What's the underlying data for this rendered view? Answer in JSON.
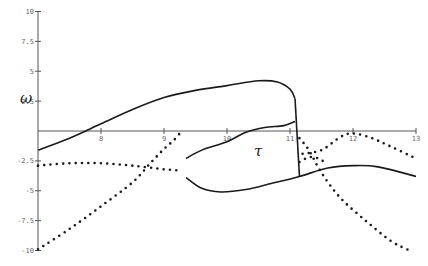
{
  "chart_data": {
    "type": "line",
    "title": "",
    "xlabel": "τ",
    "ylabel": "ω",
    "xlim": [
      7,
      13
    ],
    "ylim": [
      -10,
      10
    ],
    "grid": false,
    "legend": null,
    "x_ticks": [
      8,
      9,
      10,
      11,
      12,
      13
    ],
    "x_tick_labels": [
      "8",
      "9",
      "10",
      "11",
      "12",
      "13"
    ],
    "y_ticks": [
      10,
      7.5,
      5,
      2.5,
      -2.5,
      -5,
      -7.5,
      -10
    ],
    "y_tick_labels": [
      "10",
      "7.5",
      "5",
      "2.5",
      "-2.5",
      "-5",
      "-7.5",
      "-10"
    ],
    "series": [
      {
        "name": "solid upper branch",
        "style": "solid",
        "points": [
          [
            7.0,
            -1.6
          ],
          [
            7.5,
            -0.6
          ],
          [
            8.0,
            0.6
          ],
          [
            8.5,
            1.8
          ],
          [
            9.0,
            2.8
          ],
          [
            9.5,
            3.4
          ],
          [
            10.0,
            3.8
          ],
          [
            10.5,
            4.2
          ],
          [
            10.8,
            4.1
          ],
          [
            11.0,
            3.5
          ],
          [
            11.08,
            2.7
          ]
        ]
      },
      {
        "name": "solid vertical jump",
        "style": "solid",
        "points": [
          [
            11.08,
            2.7
          ],
          [
            11.15,
            -3.8
          ]
        ]
      },
      {
        "name": "solid middle branch",
        "style": "solid",
        "points": [
          [
            9.35,
            -2.3
          ],
          [
            9.6,
            -1.6
          ],
          [
            10.0,
            -0.9
          ],
          [
            10.3,
            -0.1
          ],
          [
            10.6,
            0.3
          ],
          [
            10.9,
            0.45
          ],
          [
            11.08,
            0.8
          ]
        ]
      },
      {
        "name": "solid lower branch",
        "style": "solid",
        "points": [
          [
            9.35,
            -3.9
          ],
          [
            9.6,
            -4.8
          ],
          [
            9.9,
            -5.1
          ],
          [
            10.3,
            -4.9
          ],
          [
            10.7,
            -4.4
          ],
          [
            11.15,
            -3.8
          ],
          [
            11.6,
            -3.1
          ],
          [
            12.0,
            -2.9
          ],
          [
            12.4,
            -3.0
          ],
          [
            13.0,
            -3.8
          ]
        ]
      },
      {
        "name": "dotted flat branch",
        "style": "dotted",
        "points": [
          [
            7.0,
            -2.9
          ],
          [
            7.5,
            -2.7
          ],
          [
            8.0,
            -2.7
          ],
          [
            8.5,
            -2.9
          ],
          [
            9.0,
            -3.2
          ],
          [
            9.25,
            -3.3
          ]
        ]
      },
      {
        "name": "dotted rising branch",
        "style": "dotted",
        "points": [
          [
            7.0,
            -9.9
          ],
          [
            7.5,
            -8.2
          ],
          [
            8.0,
            -6.3
          ],
          [
            8.5,
            -4.3
          ],
          [
            8.8,
            -2.6
          ],
          [
            9.0,
            -1.5
          ],
          [
            9.15,
            -0.8
          ],
          [
            9.25,
            -0.2
          ]
        ]
      },
      {
        "name": "dotted right peak branch",
        "style": "dotted",
        "points": [
          [
            11.2,
            -1.9
          ],
          [
            11.5,
            -1.6
          ],
          [
            11.8,
            -0.5
          ],
          [
            12.0,
            -0.2
          ],
          [
            12.3,
            -0.6
          ],
          [
            12.6,
            -1.3
          ],
          [
            13.0,
            -2.3
          ]
        ]
      },
      {
        "name": "dotted right falling branch",
        "style": "dotted",
        "points": [
          [
            11.15,
            -0.6
          ],
          [
            11.3,
            -1.6
          ],
          [
            11.5,
            -3.5
          ],
          [
            11.8,
            -5.6
          ],
          [
            12.2,
            -7.5
          ],
          [
            12.6,
            -9.2
          ],
          [
            12.9,
            -10.0
          ]
        ]
      },
      {
        "name": "dotted short connector",
        "style": "dotted",
        "points": [
          [
            11.15,
            -2.6
          ],
          [
            11.3,
            -2.2
          ],
          [
            11.45,
            -2.3
          ],
          [
            11.6,
            -2.8
          ]
        ]
      }
    ]
  },
  "colors": {
    "line": "#1a1a1a",
    "axis": "#555555",
    "tick_text": "#666666",
    "background": "#ffffff"
  }
}
